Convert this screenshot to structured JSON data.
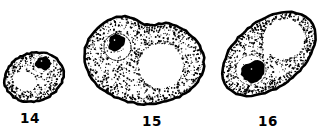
{
  "page": {
    "background": "#ffffff"
  },
  "figure": {
    "type": "line-art-cell-diagram",
    "ink_color": "#000000",
    "paper_color": "#ffffff",
    "cells": [
      {
        "label": "14"
      },
      {
        "label": "15"
      },
      {
        "label": "16"
      }
    ]
  }
}
